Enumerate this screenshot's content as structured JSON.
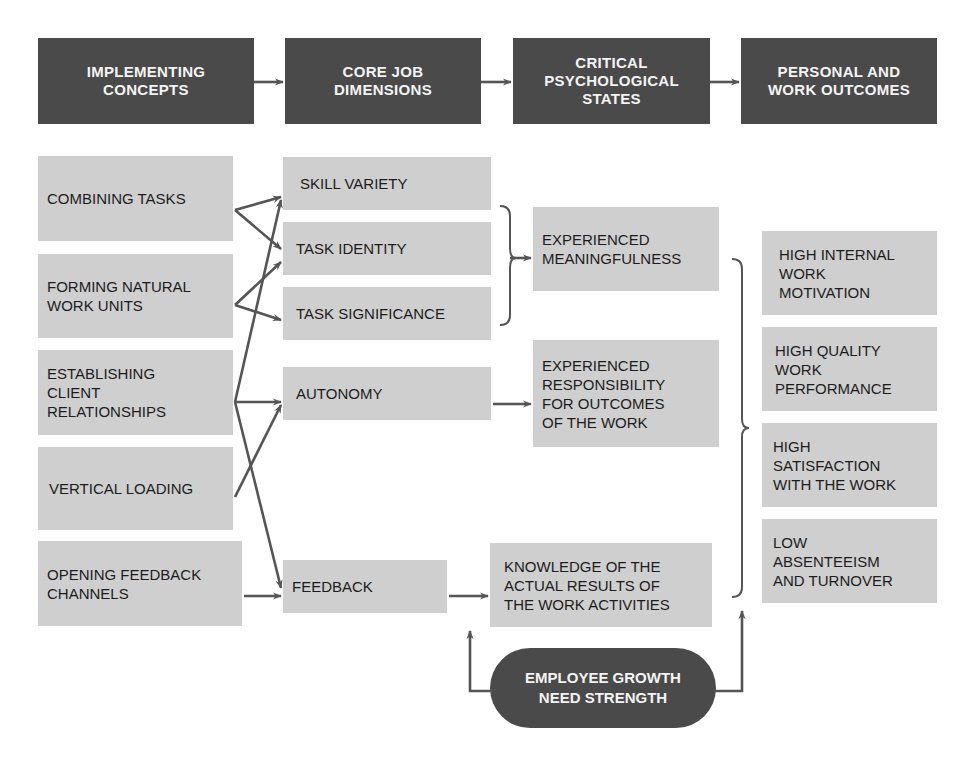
{
  "headers": [
    {
      "label": "IMPLEMENTING\nCONCEPTS"
    },
    {
      "label": "CORE JOB\nDIMENSIONS"
    },
    {
      "label": "CRITICAL\nPSYCHOLOGICAL\nSTATES"
    },
    {
      "label": "PERSONAL AND\nWORK OUTCOMES"
    }
  ],
  "implementing_concepts": [
    {
      "label": "COMBINING TASKS"
    },
    {
      "label": "FORMING NATURAL\nWORK UNITS"
    },
    {
      "label": "ESTABLISHING\nCLIENT\nRELATIONSHIPS"
    },
    {
      "label": "VERTICAL LOADING"
    },
    {
      "label": "OPENING FEEDBACK\nCHANNELS"
    }
  ],
  "core_job_dimensions": [
    {
      "label": "SKILL VARIETY"
    },
    {
      "label": "TASK IDENTITY"
    },
    {
      "label": "TASK SIGNIFICANCE"
    },
    {
      "label": "AUTONOMY"
    },
    {
      "label": "FEEDBACK"
    }
  ],
  "psychological_states": [
    {
      "label": "EXPERIENCED\nMEANINGFULNESS"
    },
    {
      "label": "EXPERIENCED\nRESPONSIBILITY\nFOR OUTCOMES\nOF THE WORK"
    },
    {
      "label": "KNOWLEDGE OF THE\nACTUAL RESULTS OF\nTHE WORK ACTIVITIES"
    }
  ],
  "outcomes": [
    {
      "label": "HIGH INTERNAL\nWORK\nMOTIVATION"
    },
    {
      "label": "HIGH QUALITY\nWORK\nPERFORMANCE"
    },
    {
      "label": "HIGH\nSATISFACTION\nWITH THE WORK"
    },
    {
      "label": "LOW\nABSENTEEISM\nAND TURNOVER"
    }
  ],
  "moderator": {
    "label": "EMPLOYEE GROWTH\nNEED STRENGTH"
  },
  "colors": {
    "header_fill": "#4a4a4a",
    "box_fill": "#cfcfcf",
    "line": "#555555"
  }
}
